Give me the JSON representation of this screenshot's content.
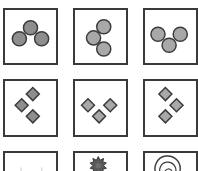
{
  "puzzle": {
    "title": "",
    "colors": {
      "border": "#3a3a3a",
      "stroke": "#3c3c3c",
      "fill_dark": "#8e8e8e",
      "fill_light": "#a8a8a8",
      "background": "#ffffff"
    },
    "rows": [
      {
        "shape": "circle",
        "cells": [
          {
            "id": "r1c1",
            "shape": "circle",
            "count": 3,
            "arrangement": "arch (one top-center, two bottom)",
            "fill": "dark"
          },
          {
            "id": "r1c2",
            "shape": "circle",
            "count": 3,
            "arrangement": "chevron pointing left (top, middle-left, bottom)",
            "fill": "light"
          },
          {
            "id": "r1c3",
            "shape": "circle",
            "count": 3,
            "arrangement": "V (two top, one bottom-center)",
            "fill": "light"
          }
        ]
      },
      {
        "shape": "diamond",
        "cells": [
          {
            "id": "r2c1",
            "shape": "diamond",
            "count": 3,
            "arrangement": "chevron pointing left",
            "fill": "dark"
          },
          {
            "id": "r2c2",
            "shape": "diamond",
            "count": 3,
            "arrangement": "V (two top, one bottom-center)",
            "fill": "light"
          },
          {
            "id": "r2c3",
            "shape": "diamond",
            "count": 3,
            "arrangement": "chevron pointing right",
            "fill": "light"
          }
        ]
      },
      {
        "shape": "partial (cropped)",
        "cells": [
          {
            "id": "r3c1",
            "shape": "faint marks",
            "count": 2,
            "arrangement": "cropped",
            "fill": "none"
          },
          {
            "id": "r3c2",
            "shape": "gear/star",
            "count": 1,
            "arrangement": "cropped",
            "fill": "dark"
          },
          {
            "id": "r3c3",
            "shape": "spiral arc",
            "count": 1,
            "arrangement": "cropped",
            "fill": "none"
          }
        ]
      }
    ]
  }
}
